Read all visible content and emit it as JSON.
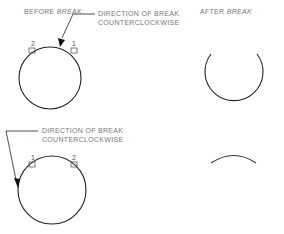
{
  "headings": {
    "before_prefix": "BEFORE ",
    "before_em": "BREAK",
    "after_prefix": "AFTER ",
    "after_em": "BREAK"
  },
  "top_example": {
    "callout_line1": "DIRECTION OF BREAK",
    "callout_line2": "COUNTERCLOCKWISE",
    "point_left": "2",
    "point_right": "1"
  },
  "bottom_example": {
    "callout_line1": "DIRECTION OF BREAK",
    "callout_line2": "COUNTERCLOCKWISE",
    "point_left": "1",
    "point_right": "2"
  },
  "colors": {
    "line": "#222222",
    "text": "#777777"
  }
}
